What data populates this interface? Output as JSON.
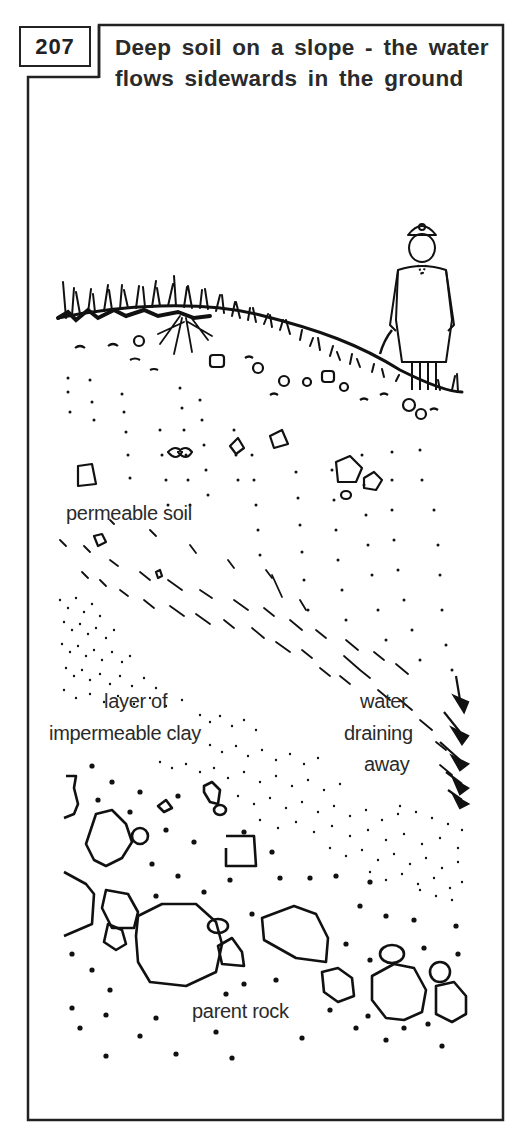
{
  "figure": {
    "number": "207",
    "title": "Deep soil on a slope - the water flows sidewards in the ground"
  },
  "labels": {
    "permeable_soil": "permeable soil",
    "clay_line1": "layer of",
    "clay_line2": "impermeable clay",
    "water_line1": "water",
    "water_line2": "draining",
    "water_line3": "away",
    "parent_rock": "parent rock"
  },
  "colors": {
    "ink": "#222222",
    "background": "#ffffff"
  }
}
